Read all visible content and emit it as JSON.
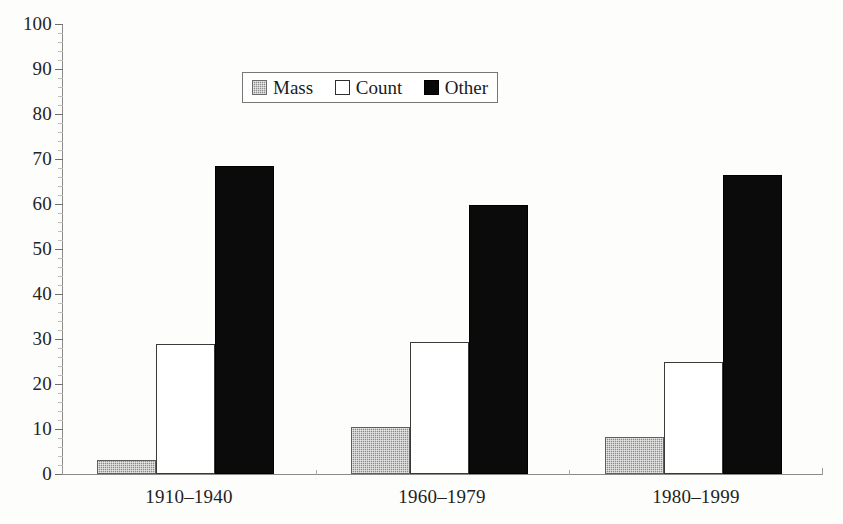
{
  "chart_data": {
    "type": "bar",
    "title": "",
    "subtitle": "",
    "xlabel": "",
    "ylabel": "",
    "categories": [
      "1910–1940",
      "1960–1979",
      "1980–1999"
    ],
    "series": [
      {
        "name": "Mass",
        "values": [
          3.1,
          10.5,
          8.2
        ],
        "color": "#8c8c8c",
        "pattern": "dotted-gray"
      },
      {
        "name": "Count",
        "values": [
          28.9,
          29.4,
          24.8
        ],
        "color": "#ffffff",
        "pattern": "open-white"
      },
      {
        "name": "Other",
        "values": [
          68.4,
          59.8,
          66.5
        ],
        "color": "#0b0b0b",
        "pattern": "solid-black"
      }
    ],
    "ylim": [
      0,
      100
    ],
    "yticks": [
      0,
      10,
      20,
      30,
      40,
      50,
      60,
      70,
      80,
      90,
      100
    ],
    "ytick_labels": [
      "0",
      "10",
      "20",
      "30",
      "40",
      "50",
      "60",
      "70",
      "80",
      "90",
      "100"
    ],
    "ytick_minor_step": 2,
    "grid": false,
    "legend_position": "top-center",
    "legend_border": true,
    "axis_color": "#8a8a88"
  },
  "legend": {
    "entries": [
      {
        "label": "Mass",
        "swatch": "swatch-mass-dotted-gray"
      },
      {
        "label": "Count",
        "swatch": "swatch-count-open-white"
      },
      {
        "label": "Other",
        "swatch": "swatch-other-solid-black"
      }
    ]
  },
  "axes": {
    "y": {
      "labels": [
        "100",
        "90",
        "80",
        "70",
        "60",
        "50",
        "40",
        "30",
        "20",
        "10",
        "0"
      ]
    },
    "x": {
      "labels": [
        "1910–1940",
        "1960–1979",
        "1980–1999"
      ]
    }
  }
}
